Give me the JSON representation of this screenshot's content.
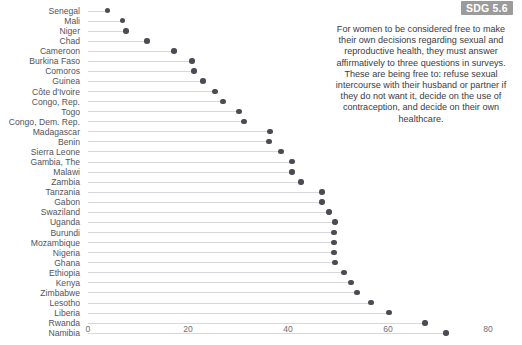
{
  "badge": {
    "label": "SDG 5.6"
  },
  "annotation": {
    "text": "For women to be considered free to make their own decisions regarding sexual and reproductive health, they must answer affirmatively to three questions in surveys. These are being free to: refuse sexual intercourse with their husband or partner if they do not want it, decide on the use of contraception, and decide on their own healthcare."
  },
  "colors": {
    "dot": "#4b4b53",
    "line": "#d8d8dc",
    "label": "#53535c",
    "badge_bg": "#9b9b9b",
    "badge_text": "#ffffff",
    "annotation_text": "#3b3b44"
  },
  "chart_data": {
    "type": "bar",
    "subtype": "lollipop-horizontal",
    "title": "",
    "xlabel": "",
    "ylabel": "",
    "xlim": [
      0,
      80
    ],
    "xticks": [
      0,
      20,
      40,
      60,
      80
    ],
    "grid": false,
    "legend": null,
    "orientation": "horizontal",
    "sorted": "ascending",
    "categories": [
      "Senegal",
      "Mali",
      "Niger",
      "Chad",
      "Cameroon",
      "Burkina Faso",
      "Comoros",
      "Guinea",
      "Côte d'Ivoire",
      "Congo, Rep.",
      "Togo",
      "Congo, Dem. Rep.",
      "Madagascar",
      "Benin",
      "Sierra Leone",
      "Gambia, The",
      "Malawi",
      "Zambia",
      "Tanzania",
      "Gabon",
      "Swaziland",
      "Uganda",
      "Burundi",
      "Mozambique",
      "Nigeria",
      "Ghana",
      "Ethiopia",
      "Kenya",
      "Zimbabwe",
      "Lesotho",
      "Liberia",
      "Rwanda",
      "Namibia"
    ],
    "values": [
      3.9,
      6.9,
      7.6,
      11.8,
      17.2,
      20.8,
      21.2,
      23.0,
      25.4,
      27.0,
      30.2,
      31.2,
      36.4,
      36.2,
      38.6,
      40.8,
      40.8,
      42.6,
      46.8,
      46.8,
      48.2,
      49.4,
      49.2,
      49.2,
      49.2,
      49.4,
      51.2,
      52.6,
      53.8,
      56.6,
      60.2,
      67.4,
      71.6
    ]
  }
}
